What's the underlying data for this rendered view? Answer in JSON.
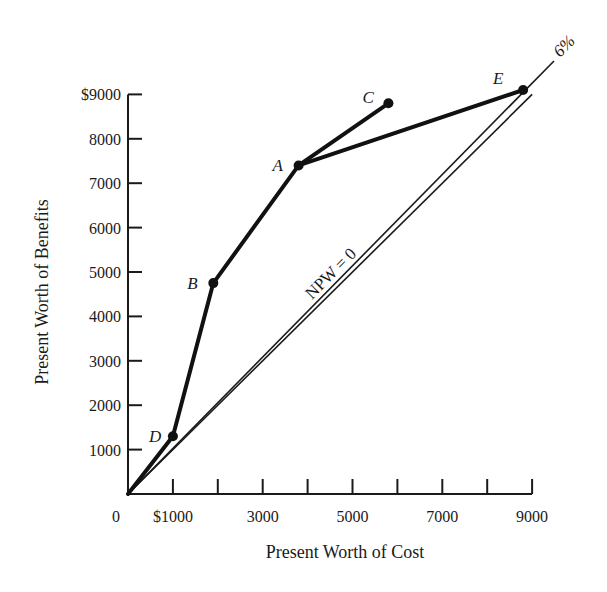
{
  "chart_data": {
    "type": "line",
    "title": "",
    "xlabel": "Present Worth of Cost",
    "ylabel": "Present Worth of Benefits",
    "xlim": [
      0,
      9000
    ],
    "ylim": [
      0,
      9000
    ],
    "grid": false,
    "x_ticks": [
      1000,
      2000,
      3000,
      4000,
      5000,
      6000,
      7000,
      8000,
      9000
    ],
    "x_tick_labels": [
      {
        "value": 0,
        "label": "0"
      },
      {
        "value": 1000,
        "label": "$1000"
      },
      {
        "value": 3000,
        "label": "3000"
      },
      {
        "value": 5000,
        "label": "5000"
      },
      {
        "value": 7000,
        "label": "7000"
      },
      {
        "value": 9000,
        "label": "9000"
      }
    ],
    "y_ticks": [
      1000,
      2000,
      3000,
      4000,
      5000,
      6000,
      7000,
      8000,
      9000
    ],
    "y_tick_labels": [
      {
        "value": 1000,
        "label": "1000"
      },
      {
        "value": 2000,
        "label": "2000"
      },
      {
        "value": 3000,
        "label": "3000"
      },
      {
        "value": 4000,
        "label": "4000"
      },
      {
        "value": 5000,
        "label": "5000"
      },
      {
        "value": 6000,
        "label": "6000"
      },
      {
        "value": 7000,
        "label": "7000"
      },
      {
        "value": 8000,
        "label": "8000"
      },
      {
        "value": 9000,
        "label": "$9000"
      }
    ],
    "points": [
      {
        "label": "D",
        "cost": 1000,
        "benefit": 1300
      },
      {
        "label": "B",
        "cost": 1900,
        "benefit": 4750
      },
      {
        "label": "A",
        "cost": 3800,
        "benefit": 7400
      },
      {
        "label": "C",
        "cost": 5800,
        "benefit": 8800
      },
      {
        "label": "E",
        "cost": 8800,
        "benefit": 9100
      }
    ],
    "series": [
      {
        "name": "Increment path 0-D-B-A-C",
        "points": [
          [
            0,
            0
          ],
          [
            1000,
            1300
          ],
          [
            1900,
            4750
          ],
          [
            3800,
            7400
          ],
          [
            5800,
            8800
          ]
        ]
      },
      {
        "name": "Increment A-E",
        "points": [
          [
            3800,
            7400
          ],
          [
            8800,
            9100
          ]
        ]
      }
    ],
    "reference_lines": [
      {
        "name": "NPW = 0",
        "label": "NPW = 0",
        "points": [
          [
            0,
            0
          ],
          [
            9000,
            9000
          ]
        ]
      },
      {
        "name": "6% rate line",
        "label": "6%",
        "points": [
          [
            0,
            0
          ],
          [
            9700,
            9800
          ]
        ]
      }
    ],
    "annotations": [
      "NPW = 0",
      "6%",
      "A",
      "B",
      "C",
      "D",
      "E"
    ]
  }
}
